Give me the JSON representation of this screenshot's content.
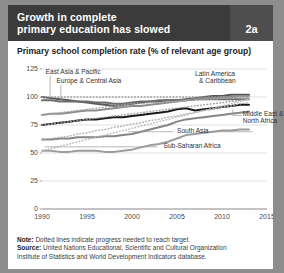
{
  "header": {
    "title_line1": "Growth in complete",
    "title_line2": "primary education has slowed",
    "badge": "2a",
    "badge_bg": "#4e4e4e",
    "bg": "#3b3b3b"
  },
  "subtitle": "Primary school completion rate (% of relevant age group)",
  "footer": {
    "note_label": "Note:",
    "note_text": " Dotted lines indicate progress needed to reach target.",
    "source_label": "Source:",
    "source_text": " United Nations Educational, Scientific and Cultural Organization",
    "source_text2": "Institute of Statistics and World Development Indicators database."
  },
  "chart_data": {
    "type": "line",
    "title": "Growth in complete primary education has slowed",
    "subtitle": "Primary school completion rate (% of relevant age group)",
    "xlabel": "",
    "ylabel": "",
    "xlim": [
      1990,
      2015
    ],
    "ylim": [
      0,
      125
    ],
    "xticks": [
      "1990",
      "1995",
      "2000",
      "2005",
      "2010",
      "2015"
    ],
    "xtick_values": [
      1990,
      1995,
      2000,
      2005,
      2010,
      2015
    ],
    "yticks": [
      "0",
      "25",
      "50",
      "75",
      "100",
      "125"
    ],
    "ytick_values": [
      0,
      25,
      50,
      75,
      100,
      125
    ],
    "grid": "horizontal",
    "legend": "inline-annotations",
    "x": [
      1990,
      1991,
      1992,
      1993,
      1994,
      1995,
      1996,
      1997,
      1998,
      1999,
      2000,
      2001,
      2002,
      2003,
      2004,
      2005,
      2006,
      2007,
      2008,
      2009,
      2010,
      2011,
      2012,
      2013
    ],
    "series": [
      {
        "name": "East Asia & Pacific",
        "style": "solid",
        "color": "#575757",
        "values": [
          100,
          99,
          98,
          97,
          96,
          95,
          94,
          93,
          92,
          93,
          94,
          95,
          96,
          96,
          97,
          97,
          98,
          99,
          100,
          101,
          101,
          102,
          102,
          102
        ]
      },
      {
        "name": "East Asia & Pacific target",
        "style": "dotted",
        "color": "#9a9a9a",
        "values": [
          100,
          100,
          100,
          100,
          100,
          100,
          100,
          100,
          100,
          100,
          100,
          100,
          100,
          100,
          100,
          100,
          100,
          100,
          100,
          100,
          100,
          100,
          100,
          100
        ]
      },
      {
        "name": "Europe & Central Asia",
        "style": "solid",
        "color": "#6e6e6e",
        "values": [
          97,
          97,
          96,
          96,
          96,
          96,
          95,
          95,
          94,
          94,
          95,
          96,
          96,
          97,
          97,
          97,
          97,
          98,
          98,
          98,
          98,
          98,
          98,
          98
        ]
      },
      {
        "name": "Latin America & Caribbean",
        "style": "solid",
        "color": "#8c8c8c",
        "values": [
          84,
          85,
          85,
          86,
          87,
          88,
          88,
          89,
          90,
          91,
          92,
          92,
          93,
          94,
          95,
          96,
          97,
          98,
          99,
          99,
          100,
          100,
          101,
          101
        ]
      },
      {
        "name": "Latin America & Caribbean target",
        "style": "dotted",
        "color": "#a8a8a8",
        "values": [
          84,
          85,
          86,
          87,
          88,
          89,
          90,
          91,
          92,
          93,
          94,
          94,
          95,
          95,
          96,
          96,
          97,
          97,
          98,
          98,
          99,
          99,
          100,
          100
        ]
      },
      {
        "name": "Middle East & North Africa",
        "style": "solid",
        "color": "#1a1a1a",
        "values": [
          75,
          76,
          77,
          78,
          79,
          80,
          80,
          81,
          82,
          82,
          83,
          84,
          85,
          86,
          87,
          89,
          90,
          88,
          89,
          90,
          91,
          92,
          93,
          93
        ]
      },
      {
        "name": "Middle East & North Africa target",
        "style": "dotted",
        "color": "#9e9e9e",
        "values": [
          75,
          76,
          77,
          78,
          79,
          80,
          81,
          82,
          83,
          84,
          85,
          86,
          87,
          88,
          89,
          90,
          91,
          92,
          93,
          94,
          95,
          96,
          97,
          98
        ]
      },
      {
        "name": "South Asia",
        "style": "solid",
        "color": "#858585",
        "values": [
          62,
          62,
          63,
          63,
          64,
          64,
          64,
          65,
          65,
          66,
          67,
          69,
          71,
          73,
          75,
          78,
          80,
          81,
          82,
          83,
          84,
          85,
          86,
          87
        ]
      },
      {
        "name": "South Asia target",
        "style": "dotted",
        "color": "#b0b0b0",
        "values": [
          62,
          63,
          64,
          65,
          67,
          68,
          70,
          71,
          73,
          74,
          76,
          77,
          79,
          80,
          82,
          83,
          85,
          86,
          88,
          89,
          91,
          92,
          94,
          95
        ]
      },
      {
        "name": "Sub-Saharan Africa",
        "style": "solid",
        "color": "#9c9c9c",
        "values": [
          52,
          52,
          51,
          51,
          52,
          52,
          52,
          51,
          51,
          52,
          53,
          55,
          57,
          58,
          60,
          63,
          66,
          67,
          68,
          69,
          70,
          70,
          71,
          71
        ]
      },
      {
        "name": "Sub-Saharan Africa target",
        "style": "dotted",
        "color": "#bcbcbc",
        "values": [
          52,
          54,
          56,
          58,
          60,
          62,
          64,
          66,
          68,
          70,
          72,
          74,
          76,
          78,
          80,
          82,
          84,
          86,
          88,
          90,
          92,
          94,
          96,
          98
        ]
      }
    ],
    "annotations": [
      {
        "text": "East Asia & Pacific",
        "x": 1990.4,
        "y": 122
      },
      {
        "text": "Europe & Central Asia",
        "x": 1991.6,
        "y": 114
      },
      {
        "text": "Latin America & Caribbean",
        "x": 2007.0,
        "y": 121
      },
      {
        "text": "Middle East & North Africa",
        "x": 2012.3,
        "y": 85
      },
      {
        "text": "South Asia",
        "x": 2005.0,
        "y": 70
      },
      {
        "text": "Sub-Saharan Africa",
        "x": 2003.5,
        "y": 56
      }
    ]
  }
}
